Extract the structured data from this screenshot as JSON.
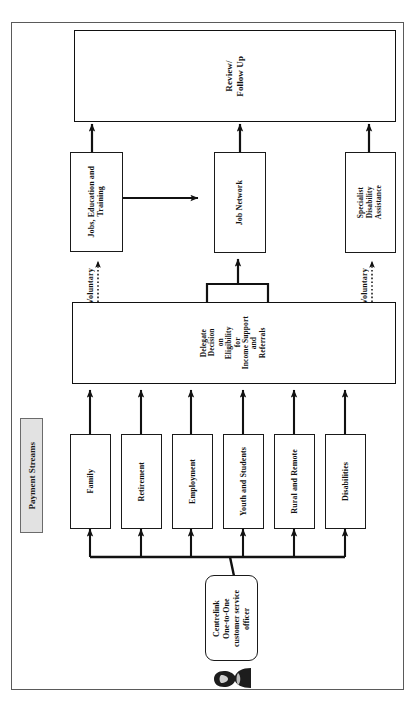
{
  "diagram": {
    "title_chip": "Payment Streams",
    "orientation": "rotated-90",
    "boxes": {
      "review": "Review/\nFollow Up",
      "jobs_education": "Jobs, Education and\nTraining",
      "job_network": "Job Network",
      "specialist": "Specialist\nDisability\nAssistance",
      "delegate": "Delegate\nDecision\non\nEligibility\nfor\nIncome Support\nand\nReferrals",
      "actor": "Centrelink\nOne-to-One\ncustomer service\nofficer"
    },
    "payment_streams": [
      {
        "label": "Family"
      },
      {
        "label": "Retirement"
      },
      {
        "label": "Employment"
      },
      {
        "label": "Youth and Students"
      },
      {
        "label": "Rural and Remote"
      },
      {
        "label": "Disabilities"
      }
    ],
    "edge_labels": {
      "voluntary_left": "Voluntary",
      "voluntary_right": "Voluntary"
    },
    "icons": {
      "person": "person-silhouette-icon"
    },
    "colors": {
      "line": "#111111",
      "box_border": "#1a1a1a",
      "frame_border": "#5a5a5a",
      "chip_fill": "#e2e2e2",
      "background": "#ffffff"
    }
  }
}
